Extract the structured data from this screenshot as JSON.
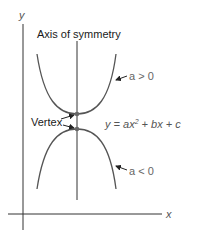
{
  "diagram": {
    "axes": {
      "x_label": "x",
      "y_label": "y"
    },
    "labels": {
      "axis_of_symmetry": "Axis of symmetry",
      "vertex": "Vertex",
      "a_positive": "a > 0",
      "a_negative": "a < 0",
      "equation_prefix": "y = ax",
      "equation_exp": "2",
      "equation_suffix": " + bx + c"
    },
    "curves": [
      {
        "name": "upward parabola",
        "condition": "a > 0",
        "opens": "up"
      },
      {
        "name": "downward parabola",
        "condition": "a < 0",
        "opens": "down"
      }
    ],
    "colors": {
      "axes": "#333333",
      "curve": "#555555",
      "vertex_dot": "#666666",
      "text": "#1a1a1a",
      "label_gray": "#666666"
    }
  }
}
